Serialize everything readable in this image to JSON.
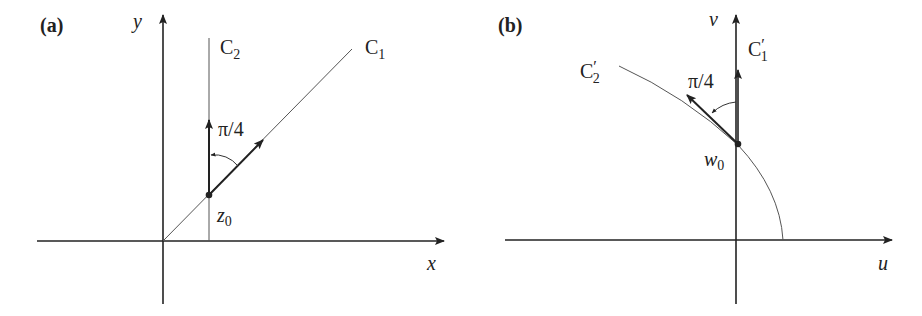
{
  "panel_a": {
    "label": "(a)",
    "y_axis_label": "y",
    "x_axis_label": "x",
    "curve_c2": {
      "main": "C",
      "sub": "2"
    },
    "curve_c1": {
      "main": "C",
      "sub": "1"
    },
    "angle_label": "π/4",
    "point_label": {
      "main": "z",
      "sub": "0"
    }
  },
  "panel_b": {
    "label": "(b)",
    "v_axis_label": "v",
    "u_axis_label": "u",
    "curve_c1_prime": {
      "main": "C",
      "prime": "′",
      "sub": "1"
    },
    "curve_c2_prime": {
      "main": "C",
      "prime": "′",
      "sub": "2"
    },
    "angle_label": "π/4",
    "point_label": {
      "main": "w",
      "sub": "0"
    }
  },
  "colors": {
    "axis": "#222222",
    "thin_line": "#555555",
    "text": "#222222"
  }
}
